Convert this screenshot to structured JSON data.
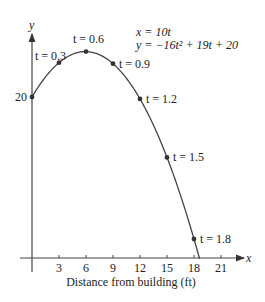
{
  "chart_data": {
    "type": "line",
    "title": "",
    "equations": [
      "x = 10t",
      "y = −16t² + 19t + 20"
    ],
    "xlabel": "Distance from building (ft)",
    "ylabel": "y",
    "xaxis_letter": "x",
    "x_ticks": [
      3,
      6,
      9,
      12,
      15,
      18,
      21
    ],
    "y_tick_labels": [
      {
        "value": 20,
        "label": "20"
      }
    ],
    "xlim": [
      0,
      22.5
    ],
    "ylim": [
      0,
      28
    ],
    "grid": false,
    "series": [
      {
        "name": "trajectory",
        "param": "t",
        "x_formula": "10t",
        "y_formula": "-16t^2 + 19t + 20",
        "t_range": [
          0,
          1.862
        ]
      }
    ],
    "points": [
      {
        "t": 0.0,
        "x": 0,
        "y": 20.0,
        "label": ""
      },
      {
        "t": 0.3,
        "x": 3,
        "y": 24.26,
        "label": "t = 0.3"
      },
      {
        "t": 0.6,
        "x": 6,
        "y": 25.64,
        "label": "t = 0.6"
      },
      {
        "t": 0.9,
        "x": 9,
        "y": 24.14,
        "label": "t = 0.9"
      },
      {
        "t": 1.2,
        "x": 12,
        "y": 19.76,
        "label": "t = 1.2"
      },
      {
        "t": 1.5,
        "x": 15,
        "y": 12.5,
        "label": "t = 1.5"
      },
      {
        "t": 1.8,
        "x": 18,
        "y": 2.36,
        "label": "t = 1.8"
      }
    ]
  },
  "colors": {
    "curve": "#333333",
    "axis": "#333333",
    "text": "#222222"
  }
}
